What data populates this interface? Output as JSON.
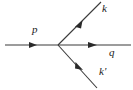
{
  "diagram": {
    "type": "feynman-diagram",
    "background_color": "#ffffff",
    "line_color": "#3a3a3a",
    "label_color": "#1a1a1a",
    "vertex": {
      "x": 58,
      "y": 45
    },
    "labels": {
      "incoming": "p",
      "outgoing_upper": "k",
      "outgoing_right": "q",
      "outgoing_lower": "k'"
    },
    "lines": [
      {
        "name": "incoming-p-line",
        "label": "p",
        "from": {
          "x": 5,
          "y": 45
        },
        "to": {
          "x": 58,
          "y": 45
        },
        "arrow_at": {
          "x": 33,
          "y": 45
        },
        "arrow_direction": "right"
      },
      {
        "name": "outgoing-k-line",
        "label": "k",
        "from": {
          "x": 58,
          "y": 45
        },
        "to": {
          "x": 101,
          "y": 2
        },
        "arrow_at": {
          "x": 79,
          "y": 24
        },
        "arrow_direction": "up-right"
      },
      {
        "name": "outgoing-q-line",
        "label": "q",
        "from": {
          "x": 58,
          "y": 45
        },
        "to": {
          "x": 131,
          "y": 45
        },
        "arrow_at": {
          "x": 93,
          "y": 45
        },
        "arrow_direction": "right"
      },
      {
        "name": "outgoing-kprime-line",
        "label": "k'",
        "from": {
          "x": 58,
          "y": 45
        },
        "to": {
          "x": 97,
          "y": 88
        },
        "arrow_at": {
          "x": 79,
          "y": 66
        },
        "arrow_direction": "down-right"
      }
    ]
  }
}
